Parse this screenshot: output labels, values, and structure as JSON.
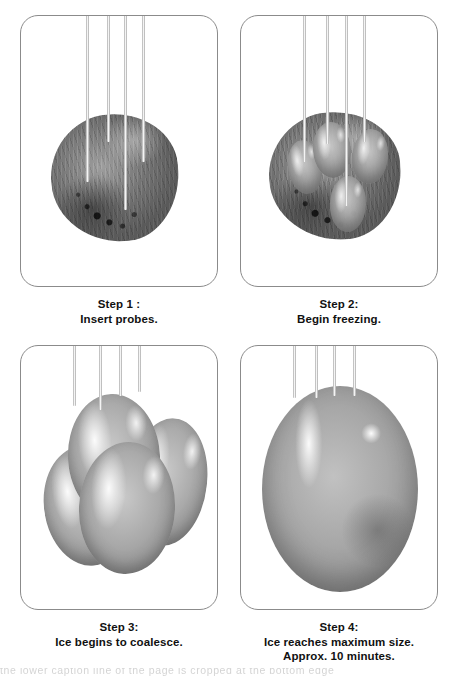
{
  "figure": {
    "background_color": "#ffffff",
    "panel_border_color": "#8b8b8b",
    "probe_count": 4
  },
  "panels": [
    {
      "id": "step-1",
      "caption_line1": "Step 1 :",
      "caption_line2": "Insert probes.",
      "illustration": "tissue-mass-with-four-probes"
    },
    {
      "id": "step-2",
      "caption_line1": "Step 2:",
      "caption_line2": "Begin freezing.",
      "illustration": "tissue-mass-with-four-small-icheballs"
    },
    {
      "id": "step-3",
      "caption_line1": "Step 3:",
      "caption_line2": "Ice begins to coalesce.",
      "illustration": "large-overlapping-iceballs"
    },
    {
      "id": "step-4",
      "caption_line1": "Step 4:",
      "caption_line2": "Ice reaches maximum size.",
      "caption_line3": "Approx. 10 minutes.",
      "illustration": "single-large-iceball"
    }
  ],
  "footer": {
    "cut_off_text": "the lower caption line of the page is cropped at the bottom edge"
  }
}
